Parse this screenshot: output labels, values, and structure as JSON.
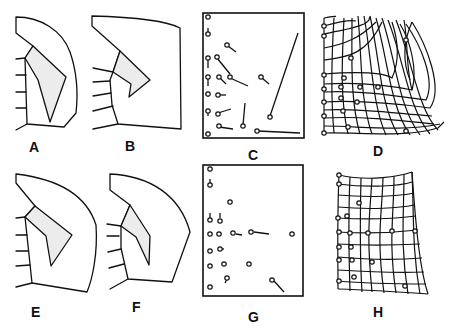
{
  "figure": {
    "panels": [
      {
        "id": "A",
        "label": "A",
        "type": "outline"
      },
      {
        "id": "B",
        "label": "B",
        "type": "outline"
      },
      {
        "id": "C",
        "label": "C",
        "type": "vector-field"
      },
      {
        "id": "D",
        "label": "D",
        "type": "deformation-grid"
      },
      {
        "id": "E",
        "label": "E",
        "type": "outline"
      },
      {
        "id": "F",
        "label": "F",
        "type": "outline"
      },
      {
        "id": "G",
        "label": "G",
        "type": "vector-field"
      },
      {
        "id": "H",
        "label": "H",
        "type": "deformation-grid"
      }
    ],
    "colors": {
      "ink": "#111111",
      "shaded_region": "#ececec",
      "background": "#ffffff"
    }
  }
}
